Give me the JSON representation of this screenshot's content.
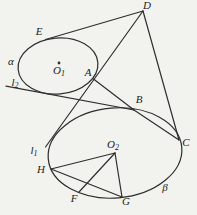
{
  "figure": {
    "colors": {
      "ink": "#2e2e2e",
      "paper": "#f2f2ee"
    },
    "labels": {
      "D": {
        "base": "D",
        "sub": ""
      },
      "E": {
        "base": "E",
        "sub": ""
      },
      "alpha": {
        "base": "α",
        "sub": ""
      },
      "O1": {
        "base": "O",
        "sub": "1"
      },
      "l2": {
        "base": "l",
        "sub": "2"
      },
      "A": {
        "base": "A",
        "sub": ""
      },
      "B": {
        "base": "B",
        "sub": ""
      },
      "C": {
        "base": "C",
        "sub": ""
      },
      "l1": {
        "base": "l",
        "sub": "1"
      },
      "O2": {
        "base": "O",
        "sub": "2"
      },
      "H": {
        "base": "H",
        "sub": ""
      },
      "F": {
        "base": "F",
        "sub": ""
      },
      "G": {
        "base": "G",
        "sub": ""
      },
      "beta": {
        "base": "β",
        "sub": ""
      }
    }
  }
}
